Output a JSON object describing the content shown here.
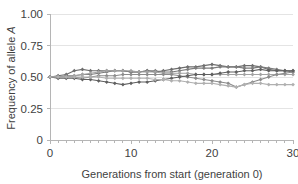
{
  "chart_data": {
    "type": "line",
    "title": "",
    "xlabel": "Generations from start (generation 0)",
    "ylabel": "Frequency of allele A",
    "xlim": [
      0,
      30
    ],
    "ylim": [
      0,
      1.0
    ],
    "grid": true,
    "grid_axis": "y",
    "legend": "none",
    "marker": "diamond",
    "x_tick_labels": [
      "0",
      "10",
      "20",
      "30"
    ],
    "x_tick_values": [
      0,
      10,
      20,
      30
    ],
    "x_minor_ticks_every": 1,
    "y_tick_labels": [
      "0",
      "0.25",
      "0.50",
      "0.75",
      "1.00"
    ],
    "y_tick_values": [
      0,
      0.25,
      0.5,
      0.75,
      1.0
    ],
    "x": [
      0,
      1,
      2,
      3,
      4,
      5,
      6,
      7,
      8,
      9,
      10,
      11,
      12,
      13,
      14,
      15,
      16,
      17,
      18,
      19,
      20,
      21,
      22,
      23,
      24,
      25,
      26,
      27,
      28,
      29,
      30
    ],
    "series": [
      {
        "name": "population-1",
        "color": "#6e6e6e",
        "values": [
          0.5,
          0.51,
          0.52,
          0.55,
          0.56,
          0.55,
          0.55,
          0.55,
          0.55,
          0.55,
          0.54,
          0.54,
          0.55,
          0.54,
          0.55,
          0.56,
          0.57,
          0.58,
          0.58,
          0.59,
          0.6,
          0.59,
          0.58,
          0.58,
          0.59,
          0.59,
          0.58,
          0.56,
          0.55,
          0.55,
          0.54
        ]
      },
      {
        "name": "population-2",
        "color": "#7d7d7d",
        "values": [
          0.5,
          0.5,
          0.51,
          0.51,
          0.52,
          0.52,
          0.53,
          0.54,
          0.55,
          0.55,
          0.54,
          0.54,
          0.55,
          0.55,
          0.54,
          0.54,
          0.55,
          0.56,
          0.57,
          0.57,
          0.57,
          0.58,
          0.58,
          0.58,
          0.57,
          0.57,
          0.58,
          0.57,
          0.56,
          0.55,
          0.55
        ]
      },
      {
        "name": "population-3",
        "color": "#a3a3a3",
        "values": [
          0.5,
          0.5,
          0.5,
          0.51,
          0.52,
          0.53,
          0.54,
          0.55,
          0.55,
          0.55,
          0.55,
          0.54,
          0.54,
          0.54,
          0.53,
          0.53,
          0.53,
          0.53,
          0.52,
          0.52,
          0.52,
          0.52,
          0.52,
          0.52,
          0.52,
          0.52,
          0.52,
          0.52,
          0.52,
          0.52,
          0.52
        ]
      },
      {
        "name": "population-4",
        "color": "#8c8c8c",
        "values": [
          0.5,
          0.5,
          0.5,
          0.5,
          0.49,
          0.5,
          0.51,
          0.51,
          0.51,
          0.52,
          0.52,
          0.52,
          0.52,
          0.52,
          0.52,
          0.52,
          0.51,
          0.5,
          0.49,
          0.48,
          0.47,
          0.46,
          0.45,
          0.42,
          0.44,
          0.46,
          0.48,
          0.5,
          0.52,
          0.53,
          0.54
        ]
      },
      {
        "name": "population-5",
        "color": "#606060",
        "values": [
          0.5,
          0.49,
          0.49,
          0.49,
          0.48,
          0.48,
          0.47,
          0.46,
          0.45,
          0.44,
          0.45,
          0.46,
          0.46,
          0.47,
          0.48,
          0.49,
          0.5,
          0.51,
          0.52,
          0.52,
          0.52,
          0.53,
          0.54,
          0.54,
          0.55,
          0.55,
          0.56,
          0.55,
          0.55,
          0.55,
          0.55
        ]
      },
      {
        "name": "population-6",
        "color": "#b0b0b0",
        "values": [
          0.5,
          0.5,
          0.5,
          0.5,
          0.5,
          0.5,
          0.5,
          0.49,
          0.49,
          0.49,
          0.49,
          0.49,
          0.49,
          0.48,
          0.48,
          0.47,
          0.47,
          0.46,
          0.45,
          0.45,
          0.45,
          0.44,
          0.43,
          0.42,
          0.44,
          0.45,
          0.45,
          0.44,
          0.44,
          0.44,
          0.44
        ]
      }
    ]
  },
  "colors": {
    "background": "#ffffff",
    "gridline": "#e4e4e4",
    "axis": "#b5b5b5",
    "text": "#3f3f3f"
  }
}
